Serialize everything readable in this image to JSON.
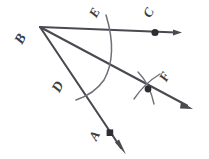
{
  "figure": {
    "background_color": "#ffffff",
    "ink_color": "#4a4a50",
    "arc_color": "#6f6f78",
    "labels": [
      {
        "id": "B",
        "text": "B",
        "x": 16,
        "y": 32,
        "rotation": -62,
        "size": 14
      },
      {
        "id": "E",
        "text": "E",
        "x": 90,
        "y": 6,
        "rotation": -62,
        "size": 13
      },
      {
        "id": "C",
        "text": "C",
        "x": 144,
        "y": 6,
        "rotation": -62,
        "size": 13
      },
      {
        "id": "D",
        "text": "D",
        "x": 53,
        "y": 80,
        "rotation": -62,
        "size": 14
      },
      {
        "id": "F",
        "text": "F",
        "x": 160,
        "y": 70,
        "rotation": -62,
        "size": 13
      },
      {
        "id": "A",
        "text": "A",
        "x": 90,
        "y": 129,
        "rotation": -62,
        "size": 13
      }
    ],
    "points": {
      "vertex": {
        "name": "B",
        "x": 40,
        "y": 27
      },
      "on_ray_c": {
        "name": "C",
        "x": 155,
        "y": 32
      },
      "on_ray_a": {
        "name": "A",
        "x": 110,
        "y": 133
      },
      "intersection_f": {
        "name": "F",
        "x": 148,
        "y": 89
      },
      "arc_on_ray_c": {
        "name": "E",
        "x": 108,
        "y": 30
      },
      "arc_on_ray_a": {
        "name": "D",
        "x": 79,
        "y": 95
      }
    },
    "rays": [
      {
        "id": "ray-bc",
        "from": "B",
        "through": "E",
        "to": "C",
        "tip_x": 180,
        "tip_y": 33
      },
      {
        "id": "ray-bf",
        "from": "B",
        "through": "F",
        "to": "F",
        "tip_x": 191,
        "tip_y": 108
      },
      {
        "id": "ray-ba",
        "from": "B",
        "through": "D",
        "to": "A",
        "tip_x": 125,
        "tip_y": 152
      }
    ],
    "arcs": [
      {
        "id": "arc-de",
        "note": "compass arc from E down to D centered at B"
      },
      {
        "id": "arc-f-1",
        "note": "first crossing arc at F"
      },
      {
        "id": "arc-f-2",
        "note": "second crossing arc at F"
      }
    ]
  }
}
